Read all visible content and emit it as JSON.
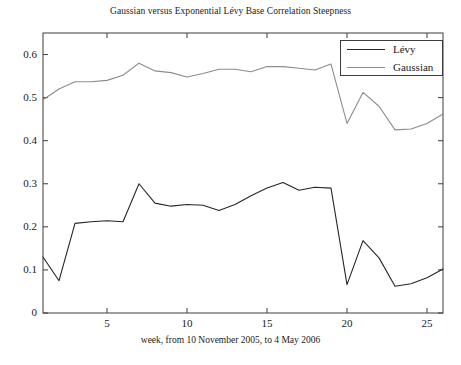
{
  "chart_data": {
    "type": "line",
    "title": "Gaussian versus Exponential Lévy Base Correlation Steepness",
    "xlabel": "week, from 10 November 2005, to 4 May 2006",
    "ylabel": "",
    "grid": false,
    "legend_position": "top-right",
    "xlim": [
      1,
      26
    ],
    "ylim": [
      0,
      0.65
    ],
    "xticks": [
      5,
      10,
      15,
      20,
      25
    ],
    "xtick_labels": [
      "5",
      "10",
      "15",
      "20",
      "25"
    ],
    "yticks": [
      0,
      0.1,
      0.2,
      0.3,
      0.4,
      0.5,
      0.6
    ],
    "ytick_labels": [
      "0",
      "0.1",
      "0.2",
      "0.3",
      "0.4",
      "0.5",
      "0.6"
    ],
    "x": [
      1,
      2,
      3,
      4,
      5,
      6,
      7,
      8,
      9,
      10,
      11,
      12,
      13,
      14,
      15,
      16,
      17,
      18,
      19,
      20,
      21,
      22,
      23,
      24,
      25,
      26
    ],
    "series": [
      {
        "name": "Lévy",
        "color": "#262626",
        "values": [
          0.13,
          0.075,
          0.208,
          0.212,
          0.214,
          0.212,
          0.3,
          0.255,
          0.248,
          0.252,
          0.25,
          0.238,
          0.252,
          0.272,
          0.29,
          0.303,
          0.285,
          0.292,
          0.29,
          0.066,
          0.168,
          0.128,
          0.062,
          0.068,
          0.082,
          0.102
        ]
      },
      {
        "name": "Gaussian",
        "color": "#8c8c8c",
        "values": [
          0.495,
          0.52,
          0.537,
          0.537,
          0.54,
          0.552,
          0.58,
          0.562,
          0.558,
          0.548,
          0.556,
          0.566,
          0.566,
          0.56,
          0.572,
          0.572,
          0.568,
          0.564,
          0.578,
          0.44,
          0.512,
          0.48,
          0.425,
          0.427,
          0.44,
          0.462
        ]
      }
    ]
  },
  "legend": {
    "entries": [
      {
        "label": "Lévy"
      },
      {
        "label": "Gaussian"
      }
    ]
  },
  "axes": {
    "frame_color": "#3c3c3c"
  }
}
